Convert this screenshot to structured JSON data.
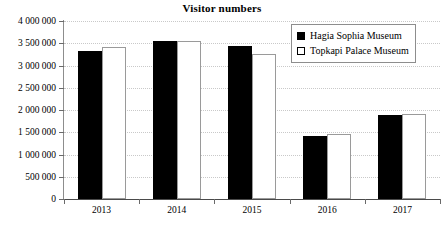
{
  "chart_data": {
    "type": "bar",
    "title": "Visitor numbers",
    "xlabel": "",
    "ylabel": "",
    "categories": [
      "2013",
      "2014",
      "2015",
      "2016",
      "2017"
    ],
    "series": [
      {
        "name": "Hagia Sophia Museum",
        "values": [
          3320000,
          3560000,
          3440000,
          1420000,
          1880000
        ],
        "swatch": "filled-black"
      },
      {
        "name": "Topkapi Palace Museum",
        "values": [
          3410000,
          3550000,
          3250000,
          1450000,
          1920000
        ],
        "swatch": "open-white"
      }
    ],
    "ylim": [
      0,
      4000000
    ],
    "ytick_values": [
      0,
      500000,
      1000000,
      1500000,
      2000000,
      2500000,
      3000000,
      3500000,
      4000000
    ],
    "ytick_labels": [
      "0",
      "500 000",
      "1 000 000",
      "1 500 000",
      "2 000 000",
      "2 500 000",
      "3 000 000",
      "3 500 000",
      "4 000 000"
    ],
    "grid": "horizontal-dotted",
    "legend_position": "top-right",
    "colors": {
      "series_a": "#000000",
      "series_b": "#ffffff",
      "grid": "#c9c9c9",
      "axis": "#4a4a4a"
    }
  }
}
